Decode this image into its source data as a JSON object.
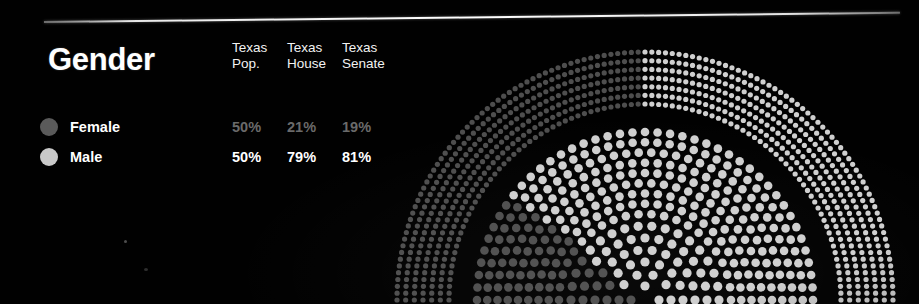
{
  "panel": {
    "title": "Gender",
    "columns": [
      {
        "line1": "Texas",
        "line2": "Pop."
      },
      {
        "line1": "Texas",
        "line2": "House"
      },
      {
        "line1": "Texas",
        "line2": "Senate"
      }
    ],
    "rows": [
      {
        "label": "Female",
        "swatch_color": "#5a5a5a",
        "text_color": "#6a6a6a",
        "values": [
          "50%",
          "21%",
          "19%"
        ]
      },
      {
        "label": "Male",
        "swatch_color": "#c9c9c9",
        "text_color": "#ffffff",
        "values": [
          "50%",
          "79%",
          "81%"
        ]
      }
    ]
  },
  "colors": {
    "background": "#000000",
    "female_dot": "#4e4e4e",
    "male_dot": "#cfcfcf",
    "rule": "#ffffff",
    "title_text": "#ffffff",
    "dim_text": "#6a6a6a"
  },
  "chart_data": {
    "type": "pie",
    "title": "Gender",
    "subtype": "nested-semicircle-dot-arc",
    "categories": [
      "Female",
      "Male"
    ],
    "legend_position": "left",
    "grid": false,
    "center": {
      "x": 645,
      "y": 300
    },
    "series": [
      {
        "name": "Texas Pop.",
        "ring": "outer",
        "radius_inner": 196,
        "radius_outer": 248,
        "rows": 7,
        "values": [
          50,
          79
        ],
        "female_pct": 50,
        "male_pct": 50,
        "labels": [
          "50%",
          "50%"
        ]
      },
      {
        "name": "Texas House",
        "ring": "middle",
        "radius_inner": 86,
        "radius_outer": 168,
        "rows": 9,
        "values": [
          21,
          79
        ],
        "female_pct": 21,
        "male_pct": 79,
        "labels": [
          "21%",
          "79%"
        ]
      },
      {
        "name": "Texas Senate",
        "ring": "inner",
        "radius_inner": 14,
        "radius_outer": 74,
        "rows": 6,
        "values": [
          19,
          81
        ],
        "female_pct": 19,
        "male_pct": 81,
        "labels": [
          "19%",
          "81%"
        ]
      }
    ]
  }
}
